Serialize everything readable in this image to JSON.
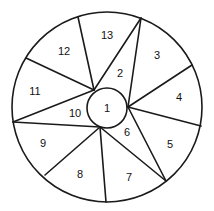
{
  "diagram": {
    "type": "segmented-circle",
    "stroke_color": "#1a1a1a",
    "background": "#ffffff",
    "outer_circle": {
      "cx": 107,
      "cy": 107,
      "r": 95
    },
    "inner_circle": {
      "cx": 107,
      "cy": 108,
      "r": 20
    },
    "lines": [
      {
        "x1": 78,
        "y1": 17,
        "x2": 94,
        "y2": 90
      },
      {
        "x1": 26,
        "y1": 58,
        "x2": 94,
        "y2": 90
      },
      {
        "x1": 13,
        "y1": 122,
        "x2": 94,
        "y2": 90
      },
      {
        "x1": 13,
        "y1": 122,
        "x2": 100,
        "y2": 127
      },
      {
        "x1": 45,
        "y1": 175,
        "x2": 100,
        "y2": 127
      },
      {
        "x1": 106,
        "y1": 202,
        "x2": 100,
        "y2": 127
      },
      {
        "x1": 166,
        "y1": 181,
        "x2": 100,
        "y2": 127
      },
      {
        "x1": 166,
        "y1": 181,
        "x2": 128,
        "y2": 107
      },
      {
        "x1": 201,
        "y1": 126,
        "x2": 128,
        "y2": 107
      },
      {
        "x1": 192,
        "y1": 65,
        "x2": 128,
        "y2": 107
      },
      {
        "x1": 141,
        "y1": 18,
        "x2": 128,
        "y2": 107
      },
      {
        "x1": 141,
        "y1": 18,
        "x2": 94,
        "y2": 90
      }
    ],
    "regions": [
      {
        "label": "1",
        "x": 107,
        "y": 108
      },
      {
        "label": "2",
        "x": 120,
        "y": 73
      },
      {
        "label": "3",
        "x": 157,
        "y": 55
      },
      {
        "label": "4",
        "x": 179,
        "y": 97
      },
      {
        "label": "5",
        "x": 170,
        "y": 144
      },
      {
        "label": "6",
        "x": 127,
        "y": 132
      },
      {
        "label": "7",
        "x": 129,
        "y": 177
      },
      {
        "label": "8",
        "x": 80,
        "y": 174
      },
      {
        "label": "9",
        "x": 43,
        "y": 143
      },
      {
        "label": "10",
        "x": 75,
        "y": 113
      },
      {
        "label": "11",
        "x": 35,
        "y": 91
      },
      {
        "label": "12",
        "x": 64,
        "y": 51
      },
      {
        "label": "13",
        "x": 107,
        "y": 35
      }
    ]
  }
}
